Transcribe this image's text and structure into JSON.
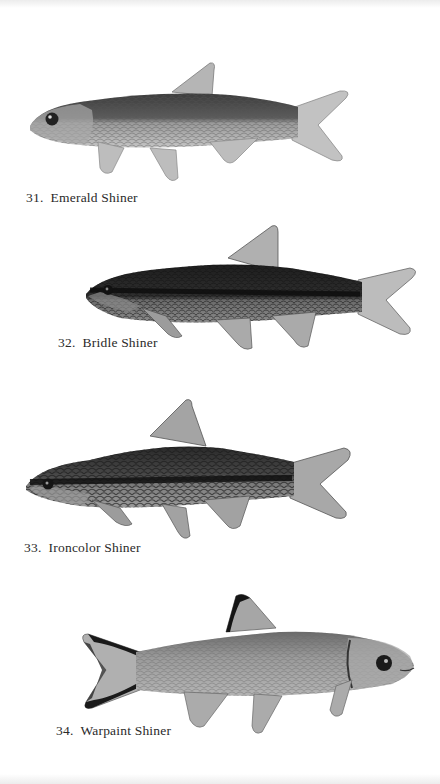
{
  "page": {
    "background": "#ffffff"
  },
  "plates": [
    {
      "number": "31.",
      "name": "Emerald Shiner",
      "caption": "31.  Emerald Shiner",
      "facing": "left",
      "body_color": "#8d8d8d",
      "back_color": "#3c3c3c",
      "fin_color": "#b8b8b8"
    },
    {
      "number": "32.",
      "name": "Bridle Shiner",
      "caption": "32.  Bridle Shiner",
      "facing": "left",
      "body_color": "#5e5e5e",
      "back_color": "#1e1e1e",
      "fin_color": "#a9a9a9"
    },
    {
      "number": "33.",
      "name": "Ironcolor Shiner",
      "caption": "33.  Ironcolor Shiner",
      "facing": "left",
      "body_color": "#6c6c6c",
      "back_color": "#262626",
      "fin_color": "#9e9e9e"
    },
    {
      "number": "34.",
      "name": "Warpaint Shiner",
      "caption": "34.  Warpaint Shiner",
      "facing": "right",
      "body_color": "#9a9a9a",
      "back_color": "#5a5a5a",
      "fin_color": "#b0b0b0",
      "fin_tip_color": "#1a1a1a"
    }
  ]
}
